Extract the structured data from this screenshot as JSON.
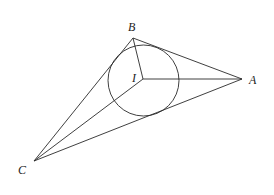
{
  "diagram": {
    "type": "geometry",
    "points": {
      "A": {
        "label": "A",
        "x": 242,
        "y": 79
      },
      "B": {
        "label": "B",
        "x": 133,
        "y": 38
      },
      "C": {
        "label": "C",
        "x": 34,
        "y": 161
      },
      "I": {
        "label": "I",
        "x": 143,
        "y": 79
      }
    },
    "incircle": {
      "cx": 143.5,
      "cy": 80.5,
      "r": 35.5
    },
    "segments": [
      "AB",
      "BC",
      "CA",
      "IA",
      "IB",
      "IC"
    ],
    "labels": {
      "A": "A",
      "B": "B",
      "C": "C",
      "I": "I"
    },
    "colors": {
      "stroke": "#2a2a2a",
      "background": "#ffffff"
    }
  }
}
